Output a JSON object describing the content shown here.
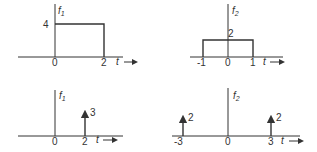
{
  "panels": [
    {
      "id": "top-left",
      "func": "f",
      "sub": "1",
      "y_tick": "4",
      "x_ticks": [
        "0",
        "2"
      ],
      "xvar": "t",
      "desc": "rectangular pulse height 4 from t=0 to t=2"
    },
    {
      "id": "top-right",
      "func": "f",
      "sub": "2",
      "y_tick": "2",
      "x_ticks": [
        "-1",
        "0",
        "1"
      ],
      "xvar": "t",
      "desc": "rectangular pulse height 2 from t=-1 to t=1"
    },
    {
      "id": "bottom-left",
      "func": "f",
      "sub": "1",
      "impulse_label": "3",
      "x_ticks": [
        "0",
        "2"
      ],
      "xvar": "t",
      "desc": "impulse of weight 3 at t=2"
    },
    {
      "id": "bottom-right",
      "func": "f",
      "sub": "2",
      "impulse_labels": [
        "2",
        "2"
      ],
      "x_ticks": [
        "-3",
        "0",
        "3"
      ],
      "xvar": "t",
      "desc": "impulses of weight 2 at t=-3 and t=3"
    }
  ],
  "colors": {
    "line": "#333333",
    "background": "#ffffff"
  }
}
